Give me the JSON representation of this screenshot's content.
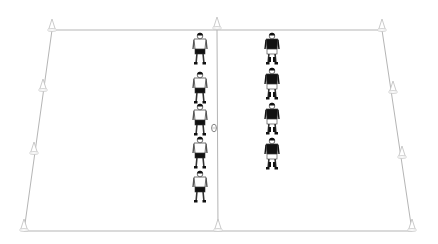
{
  "diagram": {
    "type": "rugby-drill",
    "background": "#ffffff",
    "line_color": "#b5b5b5",
    "field": {
      "top_left": [
        52,
        30
      ],
      "top_right": [
        382,
        30
      ],
      "bottom_right": [
        412,
        231
      ],
      "bottom_left": [
        24,
        231
      ],
      "halfway_line_x_top": 217,
      "halfway_line_x_bottom": 218
    },
    "cones": [
      {
        "id": "cone-top-left",
        "x": 52,
        "y": 30
      },
      {
        "id": "cone-top-center",
        "x": 217,
        "y": 28
      },
      {
        "id": "cone-top-right",
        "x": 382,
        "y": 30
      },
      {
        "id": "cone-left-upper",
        "x": 43,
        "y": 90
      },
      {
        "id": "cone-left-lower",
        "x": 34,
        "y": 153
      },
      {
        "id": "cone-right-upper",
        "x": 393,
        "y": 92
      },
      {
        "id": "cone-right-lower",
        "x": 402,
        "y": 157
      },
      {
        "id": "cone-bottom-left",
        "x": 24,
        "y": 230
      },
      {
        "id": "cone-bottom-center",
        "x": 218,
        "y": 230
      },
      {
        "id": "cone-bottom-right",
        "x": 412,
        "y": 230
      }
    ],
    "ball": {
      "x": 214,
      "y": 128
    },
    "teams": [
      {
        "name": "white-team",
        "shirt_color": "#ffffff",
        "shorts_color": "#111111",
        "x": 200,
        "players_head_y": [
          36,
          75,
          107,
          140,
          174
        ]
      },
      {
        "name": "black-team",
        "shirt_color": "#111111",
        "shorts_color": "#ffffff",
        "x": 272,
        "players_head_y": [
          36,
          71,
          106,
          141
        ]
      }
    ]
  }
}
